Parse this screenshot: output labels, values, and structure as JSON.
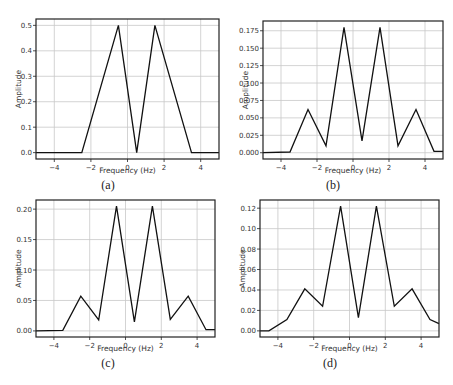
{
  "figure": {
    "captions": [
      "(a)",
      "(b)",
      "(c)",
      "(d)"
    ]
  },
  "chart_data": [
    {
      "id": "a",
      "type": "line",
      "title": "",
      "xlabel": "Frequency (Hz)",
      "ylabel": "Amplitude",
      "caption": "(a)",
      "xlim": [
        -5,
        5
      ],
      "ylim": [
        -0.025,
        0.525
      ],
      "xticks": [
        -4,
        -2,
        0,
        2,
        4
      ],
      "xtick_labels": [
        "−4",
        "−2",
        "0",
        "2",
        "4"
      ],
      "yticks": [
        0.0,
        0.1,
        0.2,
        0.3,
        0.4,
        0.5
      ],
      "ytick_labels": [
        "0.0",
        "0.1",
        "0.2",
        "0.3",
        "0.4",
        "0.5"
      ],
      "grid": true,
      "x": [
        -5,
        -2.5,
        -0.5,
        0.5,
        1.5,
        3.5,
        5
      ],
      "y": [
        0,
        0,
        0.5,
        0,
        0.5,
        0,
        0
      ],
      "frame": {
        "left": 36,
        "top": 19,
        "right": 219,
        "bottom": 159
      },
      "caption_pos": {
        "x": 108,
        "y": 178
      },
      "line_color": "#111111"
    },
    {
      "id": "b",
      "type": "line",
      "title": "",
      "xlabel": "Frequency (Hz)",
      "ylabel": "Amplitude",
      "caption": "(b)",
      "xlim": [
        -5,
        5
      ],
      "ylim": [
        -0.009,
        0.189
      ],
      "xticks": [
        -4,
        -2,
        0,
        2,
        4
      ],
      "xtick_labels": [
        "−4",
        "−2",
        "0",
        "2",
        "4"
      ],
      "yticks": [
        0.0,
        0.025,
        0.05,
        0.075,
        0.1,
        0.125,
        0.15,
        0.175
      ],
      "ytick_labels": [
        "0.000",
        "0.025",
        "0.050",
        "0.075",
        "0.100",
        "0.125",
        "0.150",
        "0.175"
      ],
      "grid": true,
      "x": [
        -5,
        -3.5,
        -2.5,
        -1.5,
        -0.5,
        0.5,
        1.5,
        2.5,
        3.5,
        4.5,
        5
      ],
      "y": [
        0.0,
        0.001,
        0.062,
        0.01,
        0.18,
        0.017,
        0.18,
        0.01,
        0.062,
        0.002,
        0.002
      ],
      "frame": {
        "left": 263,
        "top": 21,
        "right": 443,
        "bottom": 159
      },
      "caption_pos": {
        "x": 333,
        "y": 178
      },
      "line_color": "#111111"
    },
    {
      "id": "c",
      "type": "line",
      "title": "",
      "xlabel": "Frequency (Hz)",
      "ylabel": "Amplitude",
      "caption": "(c)",
      "xlim": [
        -5,
        5
      ],
      "ylim": [
        -0.01,
        0.215
      ],
      "xticks": [
        -4,
        -2,
        0,
        2,
        4
      ],
      "xtick_labels": [
        "−4",
        "−2",
        "0",
        "2",
        "4"
      ],
      "yticks": [
        0.0,
        0.05,
        0.1,
        0.15,
        0.2
      ],
      "ytick_labels": [
        "0.00",
        "0.05",
        "0.10",
        "0.15",
        "0.20"
      ],
      "grid": true,
      "x": [
        -5,
        -3.5,
        -2.5,
        -1.5,
        -0.5,
        0.5,
        1.5,
        2.5,
        3.5,
        4.5,
        5
      ],
      "y": [
        0.0,
        0.001,
        0.057,
        0.018,
        0.205,
        0.015,
        0.205,
        0.019,
        0.057,
        0.002,
        0.002
      ],
      "frame": {
        "left": 36,
        "top": 200,
        "right": 215,
        "bottom": 337
      },
      "caption_pos": {
        "x": 108,
        "y": 356
      },
      "line_color": "#111111"
    },
    {
      "id": "d",
      "type": "line",
      "title": "",
      "xlabel": "Frequency (Hz)",
      "ylabel": "Amplitude",
      "caption": "(d)",
      "xlim": [
        -5,
        5
      ],
      "ylim": [
        -0.006,
        0.128
      ],
      "xticks": [
        -4,
        -2,
        0,
        2,
        4
      ],
      "xtick_labels": [
        "−4",
        "−2",
        "0",
        "2",
        "4"
      ],
      "yticks": [
        0.0,
        0.02,
        0.04,
        0.06,
        0.08,
        0.1,
        0.12
      ],
      "ytick_labels": [
        "0.00",
        "0.02",
        "0.04",
        "0.06",
        "0.08",
        "0.10",
        "0.12"
      ],
      "grid": true,
      "x": [
        -5,
        -4.5,
        -3.5,
        -2.5,
        -1.5,
        -0.5,
        0.5,
        1.5,
        2.5,
        3.5,
        4.5,
        5
      ],
      "y": [
        0.0,
        0.0,
        0.011,
        0.041,
        0.024,
        0.122,
        0.013,
        0.122,
        0.024,
        0.041,
        0.011,
        0.007
      ],
      "frame": {
        "left": 260,
        "top": 200,
        "right": 439,
        "bottom": 337
      },
      "caption_pos": {
        "x": 330,
        "y": 356
      },
      "line_color": "#111111"
    }
  ]
}
